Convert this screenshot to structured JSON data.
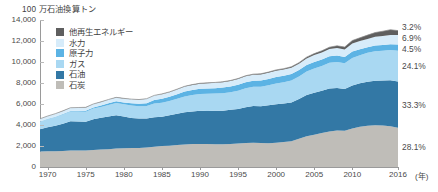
{
  "chart_data": {
    "type": "area",
    "stacked": true,
    "title": "",
    "unit_label": "100 万石油換算トン",
    "xlabel": "(年)",
    "ylabel": "",
    "ylim": [
      0,
      14000
    ],
    "ytick_values": [
      0,
      2000,
      4000,
      6000,
      8000,
      10000,
      12000,
      14000
    ],
    "ytick_labels": [
      "0",
      "2,000",
      "4,000",
      "6,000",
      "8,000",
      "10,000",
      "12,000",
      "14,000"
    ],
    "xlim": [
      1969,
      2016
    ],
    "xtick_values": [
      1970,
      1975,
      1980,
      1985,
      1990,
      1995,
      2000,
      2005,
      2010,
      2016
    ],
    "xtick_labels": [
      "1970",
      "1975",
      "1980",
      "1985",
      "1990",
      "1995",
      "2000",
      "2005",
      "2010",
      "2016"
    ],
    "grid": false,
    "legend_position": "upper-left-inside",
    "x": [
      1969,
      1970,
      1971,
      1972,
      1973,
      1974,
      1975,
      1976,
      1977,
      1978,
      1979,
      1980,
      1981,
      1982,
      1983,
      1984,
      1985,
      1986,
      1987,
      1988,
      1989,
      1990,
      1991,
      1992,
      1993,
      1994,
      1995,
      1996,
      1997,
      1998,
      1999,
      2000,
      2001,
      2002,
      2003,
      2004,
      2005,
      2006,
      2007,
      2008,
      2009,
      2010,
      2011,
      2012,
      2013,
      2014,
      2015,
      2016
    ],
    "series": [
      {
        "name": "石炭",
        "key": "coal",
        "color": "#bfbdb8",
        "share_2016": "28.1%",
        "values": [
          1480,
          1500,
          1510,
          1530,
          1560,
          1570,
          1580,
          1630,
          1670,
          1700,
          1760,
          1790,
          1800,
          1820,
          1860,
          1940,
          2000,
          2030,
          2090,
          2150,
          2180,
          2200,
          2180,
          2160,
          2170,
          2190,
          2230,
          2280,
          2310,
          2280,
          2270,
          2320,
          2380,
          2450,
          2690,
          2920,
          3080,
          3230,
          3390,
          3480,
          3460,
          3660,
          3840,
          3930,
          3970,
          3950,
          3890,
          3730
        ]
      },
      {
        "name": "石油",
        "key": "oil",
        "color": "#3378a5",
        "share_2016": "33.3%",
        "values": [
          2120,
          2280,
          2420,
          2600,
          2800,
          2770,
          2730,
          2920,
          3010,
          3120,
          3180,
          3010,
          2870,
          2790,
          2760,
          2810,
          2790,
          2900,
          2970,
          3060,
          3110,
          3150,
          3160,
          3200,
          3190,
          3260,
          3300,
          3400,
          3490,
          3510,
          3600,
          3650,
          3670,
          3700,
          3790,
          3940,
          4000,
          4030,
          4080,
          4050,
          3980,
          4100,
          4140,
          4200,
          4250,
          4290,
          4380,
          4420
        ]
      },
      {
        "name": "ガス",
        "key": "gas",
        "color": "#a9d8f2",
        "share_2016": "24.1%",
        "values": [
          720,
          780,
          830,
          880,
          930,
          940,
          950,
          1010,
          1040,
          1090,
          1150,
          1170,
          1180,
          1180,
          1200,
          1290,
          1330,
          1350,
          1430,
          1500,
          1560,
          1600,
          1630,
          1640,
          1670,
          1680,
          1740,
          1830,
          1840,
          1860,
          1910,
          1990,
          2020,
          2080,
          2150,
          2230,
          2300,
          2350,
          2450,
          2480,
          2430,
          2610,
          2670,
          2740,
          2800,
          2830,
          2880,
          2920
        ]
      },
      {
        "name": "原子力",
        "key": "nuclear",
        "color": "#5cb3e4",
        "share_2016": "4.5%",
        "values": [
          20,
          25,
          35,
          45,
          55,
          75,
          100,
          115,
          140,
          160,
          170,
          180,
          215,
          230,
          260,
          330,
          380,
          400,
          440,
          480,
          490,
          500,
          510,
          510,
          530,
          540,
          560,
          570,
          580,
          590,
          610,
          610,
          620,
          620,
          600,
          620,
          630,
          630,
          620,
          610,
          600,
          630,
          560,
          530,
          540,
          540,
          550,
          590
        ]
      },
      {
        "name": "水力",
        "key": "hydro",
        "color": "#d7ecfa",
        "share_2016": "6.9%",
        "values": [
          250,
          265,
          275,
          285,
          295,
          305,
          315,
          320,
          335,
          350,
          360,
          375,
          385,
          390,
          410,
          430,
          440,
          450,
          460,
          470,
          480,
          490,
          500,
          505,
          520,
          525,
          545,
          560,
          565,
          575,
          580,
          600,
          590,
          600,
          600,
          630,
          650,
          670,
          690,
          710,
          720,
          770,
          780,
          800,
          840,
          870,
          880,
          910
        ]
      },
      {
        "name": "他再生エネルギー",
        "key": "other_renewables",
        "color": "#5f5f5f",
        "share_2016": "3.2%",
        "values": [
          5,
          5,
          6,
          6,
          7,
          7,
          8,
          9,
          10,
          11,
          12,
          13,
          14,
          15,
          17,
          19,
          21,
          23,
          25,
          27,
          30,
          33,
          36,
          39,
          42,
          46,
          50,
          55,
          60,
          66,
          72,
          80,
          88,
          97,
          108,
          122,
          138,
          158,
          182,
          212,
          238,
          275,
          318,
          360,
          405,
          450,
          495,
          420
        ]
      }
    ],
    "annotations": {
      "right_shares": [
        "3.2%",
        "6.9%",
        "4.5%",
        "24.1%",
        "33.3%",
        "28.1%"
      ]
    }
  },
  "legend": {
    "items": [
      {
        "label": "他再生エネルギー",
        "color": "#5f5f5f"
      },
      {
        "label": "水力",
        "color": "#d7ecfa"
      },
      {
        "label": "原子力",
        "color": "#5cb3e4"
      },
      {
        "label": "ガス",
        "color": "#a9d8f2"
      },
      {
        "label": "石油",
        "color": "#3378a5"
      },
      {
        "label": "石炭",
        "color": "#bfbdb8"
      }
    ]
  }
}
